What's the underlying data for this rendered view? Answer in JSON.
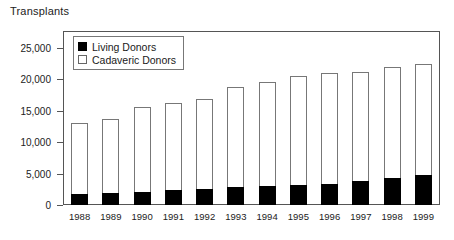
{
  "chart_data": {
    "type": "bar",
    "subtype": "stacked-vertical",
    "title": "Transplants",
    "xlabel": "",
    "ylabel": "",
    "ylim": [
      0,
      27500
    ],
    "grid": false,
    "legend_position": "top-left-inside",
    "categories": [
      "1988",
      "1989",
      "1990",
      "1991",
      "1992",
      "1993",
      "1994",
      "1995",
      "1996",
      "1997",
      "1998",
      "1999"
    ],
    "series": [
      {
        "name": "Living Donors",
        "color": "#000000",
        "values": [
          1700,
          1900,
          2100,
          2400,
          2500,
          2900,
          3000,
          3200,
          3400,
          3800,
          4300,
          4700
        ]
      },
      {
        "name": "Cadaveric Donors",
        "color": "#ffffff",
        "values": [
          11300,
          11700,
          13500,
          13800,
          14400,
          15800,
          16500,
          17300,
          17600,
          17400,
          17700,
          17700
        ]
      }
    ],
    "totals": [
      13000,
      13600,
      15600,
      16200,
      16900,
      18700,
      19500,
      20500,
      21000,
      21200,
      22000,
      22400
    ],
    "y_ticks": [
      {
        "value": 0,
        "label": "0"
      },
      {
        "value": 5000,
        "label": "5,000"
      },
      {
        "value": 10000,
        "label": "10,000"
      },
      {
        "value": 15000,
        "label": "15,000"
      },
      {
        "value": 20000,
        "label": "20,000"
      },
      {
        "value": 25000,
        "label": "25,000"
      }
    ],
    "legend": [
      {
        "label": "Living Donors",
        "swatch": "filled-square"
      },
      {
        "label": "Cadaveric Donors",
        "swatch": "hollow-square"
      }
    ]
  }
}
